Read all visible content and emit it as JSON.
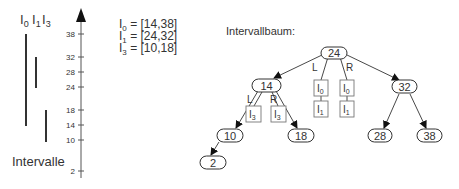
{
  "intervals_panel": {
    "header": [
      {
        "base": "I",
        "sub": "0"
      },
      {
        "base": "I",
        "sub": "1"
      },
      {
        "base": "I",
        "sub": "3"
      }
    ],
    "caption": "Intervalle",
    "bars": [
      {
        "name": "I0",
        "start": 14,
        "end": 38
      },
      {
        "name": "I1",
        "start": 24,
        "end": 32
      },
      {
        "name": "I3",
        "start": 10,
        "end": 18
      }
    ]
  },
  "axis": {
    "ticks": [
      "38",
      "32",
      "28",
      "24",
      "18",
      "14",
      "10",
      "2"
    ]
  },
  "legend": {
    "lines": [
      {
        "base": "I",
        "sub": "0",
        "text": " = [14,38]"
      },
      {
        "base": "I",
        "sub": "1",
        "text": " = [24,32]"
      },
      {
        "base": "I",
        "sub": "3",
        "text": " = [10,18]"
      }
    ]
  },
  "tree": {
    "title": "Intervallbaum:",
    "nodes": {
      "root": "24",
      "n14": "14",
      "n32": "32",
      "n10": "10",
      "n18": "18",
      "n28": "28",
      "n38": "38",
      "n2": "2"
    },
    "edge_labels": {
      "left": "L",
      "right": "R"
    },
    "root_lists": {
      "left": [
        {
          "base": "I",
          "sub": "0"
        },
        {
          "base": "I",
          "sub": "1"
        }
      ],
      "right": [
        {
          "base": "I",
          "sub": "0"
        },
        {
          "base": "I",
          "sub": "1"
        }
      ]
    },
    "n14_lists": {
      "left": [
        {
          "base": "I",
          "sub": "3"
        }
      ],
      "right": [
        {
          "base": "I",
          "sub": "3"
        }
      ]
    }
  }
}
